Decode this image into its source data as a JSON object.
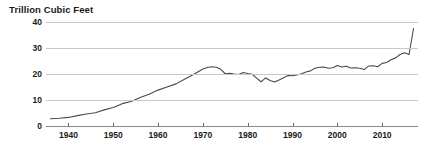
{
  "chart_data": {
    "type": "line",
    "title": "Trillion Cubic Feet",
    "xlabel": "",
    "ylabel": "Trillion Cubic Feet",
    "xlim": [
      1935,
      2018
    ],
    "ylim": [
      0,
      40
    ],
    "grid": true,
    "legend": "none",
    "ytick_labels": [
      "0",
      "10",
      "20",
      "30",
      "40"
    ],
    "ytick_values": [
      0,
      10,
      20,
      30,
      40
    ],
    "xtick_labels": [
      "1940",
      "1950",
      "1960",
      "1970",
      "1980",
      "1990",
      "2000",
      "2010"
    ],
    "xtick_values": [
      1940,
      1950,
      1960,
      1970,
      1980,
      1990,
      2000,
      2010
    ],
    "line_color": "#4a4a4a",
    "series": [
      {
        "name": "Natural gas",
        "x": [
          1936,
          1938,
          1940,
          1942,
          1944,
          1946,
          1948,
          1950,
          1952,
          1954,
          1956,
          1958,
          1960,
          1962,
          1964,
          1966,
          1968,
          1970,
          1971,
          1972,
          1973,
          1974,
          1975,
          1976,
          1977,
          1978,
          1979,
          1980,
          1981,
          1982,
          1983,
          1984,
          1985,
          1986,
          1987,
          1988,
          1989,
          1990,
          1991,
          1992,
          1993,
          1994,
          1995,
          1996,
          1997,
          1998,
          1999,
          2000,
          2001,
          2002,
          2003,
          2004,
          2005,
          2006,
          2007,
          2008,
          2009,
          2010,
          2011,
          2012,
          2013,
          2014,
          2015,
          2016,
          2017
        ],
        "y": [
          2.8,
          3.0,
          3.3,
          4.0,
          4.6,
          5.1,
          6.2,
          7.1,
          8.6,
          9.4,
          11.0,
          12.2,
          13.8,
          15.0,
          16.2,
          18.1,
          19.9,
          21.9,
          22.5,
          22.8,
          22.6,
          21.8,
          20.1,
          20.3,
          20.0,
          19.8,
          20.6,
          20.2,
          19.9,
          18.4,
          17.0,
          18.5,
          17.5,
          16.9,
          17.7,
          18.6,
          19.4,
          19.3,
          19.6,
          20.1,
          20.8,
          21.2,
          22.2,
          22.6,
          22.7,
          22.2,
          22.4,
          23.3,
          22.7,
          23.0,
          22.3,
          22.4,
          22.2,
          21.7,
          23.1,
          23.2,
          22.8,
          24.1,
          24.4,
          25.5,
          26.2,
          27.5,
          28.2,
          27.5,
          37.5
        ]
      }
    ]
  }
}
